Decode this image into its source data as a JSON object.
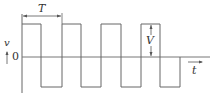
{
  "diagram": {
    "title": "",
    "type": "square-wave",
    "labels": {
      "period": "T",
      "amplitude": "V",
      "y_axis": "v",
      "x_axis": "t",
      "origin": "0"
    },
    "colors": {
      "line": "#555555",
      "text": "#333333"
    },
    "waveform": {
      "high_level": "V",
      "low_level": "-V",
      "cycles_visible": 4,
      "duty_cycle": 0.5
    }
  }
}
